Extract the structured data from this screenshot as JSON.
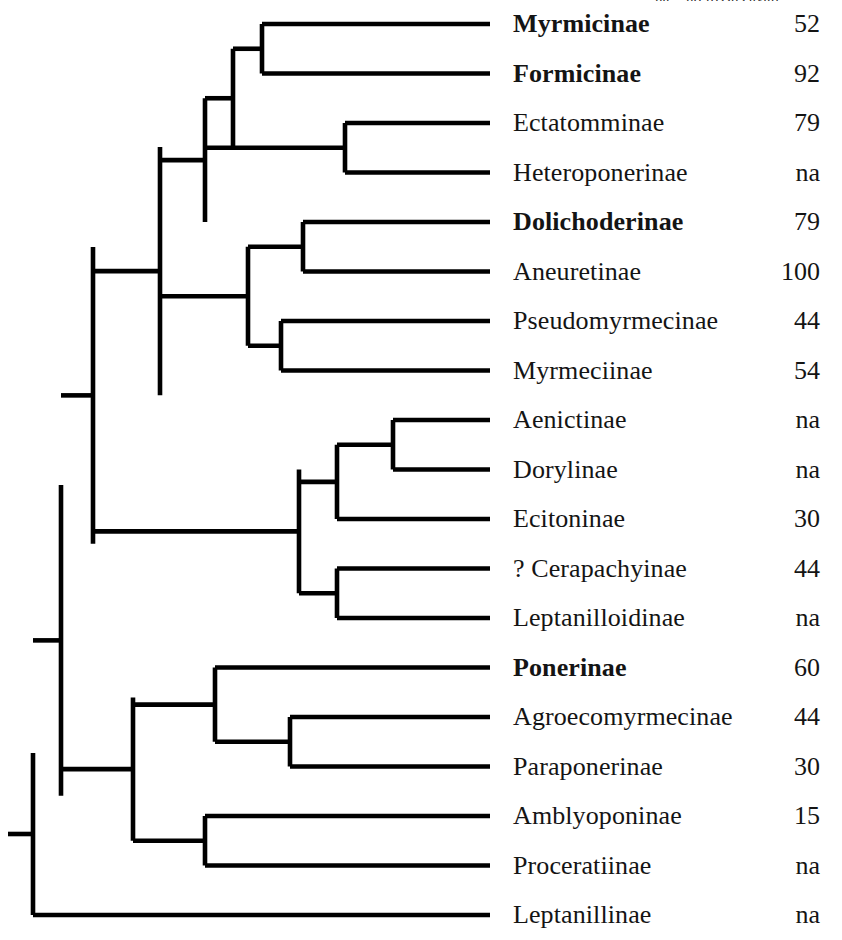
{
  "figure": {
    "legend_note": "na = no fossils avail",
    "line_color": "#000000",
    "text_color": "#141414"
  },
  "columns": {
    "taxon_header": "",
    "age_header": ""
  },
  "tips": [
    {
      "label": "Myrmicinae",
      "value": "52",
      "bold": true,
      "y": 24,
      "tip_x": 262
    },
    {
      "label": "Formicinae",
      "value": "92",
      "bold": true,
      "y": 73.5,
      "tip_x": 262
    },
    {
      "label": "Ectatomminae",
      "value": "79",
      "bold": false,
      "y": 123,
      "tip_x": 345
    },
    {
      "label": "Heteroponerinae",
      "value": "na",
      "bold": false,
      "y": 172.5,
      "tip_x": 345
    },
    {
      "label": "Dolichoderinae",
      "value": "79",
      "bold": true,
      "y": 222,
      "tip_x": 303
    },
    {
      "label": "Aneuretinae",
      "value": "100",
      "bold": false,
      "y": 271.5,
      "tip_x": 303
    },
    {
      "label": "Pseudomyrmecinae",
      "value": "44",
      "bold": false,
      "y": 321,
      "tip_x": 281
    },
    {
      "label": "Myrmeciinae",
      "value": "54",
      "bold": false,
      "y": 370.5,
      "tip_x": 281
    },
    {
      "label": "Aenictinae",
      "value": "na",
      "bold": false,
      "y": 420,
      "tip_x": 393
    },
    {
      "label": "Dorylinae",
      "value": "na",
      "bold": false,
      "y": 469.5,
      "tip_x": 393
    },
    {
      "label": "Ecitoninae",
      "value": "30",
      "bold": false,
      "y": 519,
      "tip_x": 337
    },
    {
      "label": "? Cerapachyinae",
      "value": "44",
      "bold": false,
      "y": 568.5,
      "tip_x": 337
    },
    {
      "label": "Leptanilloidinae",
      "value": "na",
      "bold": false,
      "y": 618,
      "tip_x": 337
    },
    {
      "label": "Ponerinae",
      "value": "60",
      "bold": true,
      "y": 667.5,
      "tip_x": 215
    },
    {
      "label": "Agroecomyrmecinae",
      "value": "44",
      "bold": false,
      "y": 717,
      "tip_x": 290
    },
    {
      "label": "Paraponerinae",
      "value": "30",
      "bold": false,
      "y": 766.5,
      "tip_x": 290
    },
    {
      "label": "Amblyoponinae",
      "value": "15",
      "bold": false,
      "y": 816,
      "tip_x": 205
    },
    {
      "label": "Proceratiinae",
      "value": "na",
      "bold": false,
      "y": 865.5,
      "tip_x": 205
    },
    {
      "label": "Leptanillinae",
      "value": "na",
      "bold": false,
      "y": 915,
      "tip_x": 33
    }
  ],
  "chart_data": {
    "type": "cladogram",
    "tip_count": 19,
    "taxa": [
      "Myrmicinae",
      "Formicinae",
      "Ectatomminae",
      "Heteroponerinae",
      "Dolichoderinae",
      "Aneuretinae",
      "Pseudomyrmecinae",
      "Myrmeciinae",
      "Aenictinae",
      "Dorylinae",
      "Ecitoninae",
      "? Cerapachyinae",
      "Leptanilloidinae",
      "Ponerinae",
      "Agroecomyrmecinae",
      "Paraponerinae",
      "Amblyoponinae",
      "Proceratiinae",
      "Leptanillinae"
    ],
    "values": [
      "52",
      "92",
      "79",
      "na",
      "79",
      "100",
      "44",
      "54",
      "na",
      "na",
      "30",
      "44",
      "na",
      "60",
      "44",
      "30",
      "15",
      "na",
      "na"
    ],
    "value_label": "oldest fossil age (Ma)",
    "na_meaning": "na = no fossils available",
    "bold_taxa": [
      "Myrmicinae",
      "Formicinae",
      "Dolichoderinae",
      "Ponerinae"
    ],
    "newick": "((((((Myrmicinae,Formicinae),(Ectatomminae,Heteroponerinae)),((Dolichoderinae,Aneuretinae),(Pseudomyrmecinae,Myrmeciinae))),(((Aenictinae,Dorylinae),Ecitoninae),(?Cerapachyinae,Leptanilloidinae))),((Ponerinae,(Agroecomyrmecinae,Paraponerinae)),(Amblyoponinae,Proceratiinae))),Leptanillinae);",
    "root_x": 33,
    "tip_x_end": 490,
    "tip_spacing": 49.5,
    "nodes": [
      {
        "name": "root",
        "x": 33,
        "y_top": 753,
        "y_bot": 915
      },
      {
        "name": "crown-formicidae",
        "x": 61,
        "y_top": 485,
        "y_bot": 795.75
      },
      {
        "name": "formicoid",
        "x": 93,
        "y_top": 247,
        "y_bot": 543.75
      },
      {
        "name": "formicoid-core",
        "x": 160,
        "y_top": 147,
        "y_bot": 395.25
      },
      {
        "name": "formicomorph",
        "x": 205,
        "y_top": 98.25,
        "y_bot": 222
      },
      {
        "name": "myrmicine-formica",
        "x": 233,
        "y_top": 48.75,
        "y_bot": 147.75
      },
      {
        "name": "myrm-form-pair",
        "x": 262,
        "y_top": 24,
        "y_bot": 73.5
      },
      {
        "name": "ectat-hetero",
        "x": 345,
        "y_top": 123,
        "y_bot": 172.5
      },
      {
        "name": "dolicho-clade",
        "x": 248,
        "y_top": 246.75,
        "y_bot": 345.75
      },
      {
        "name": "dolicho-aneuret",
        "x": 303,
        "y_top": 222,
        "y_bot": 271.5
      },
      {
        "name": "pseudo-myrmec",
        "x": 281,
        "y_top": 321,
        "y_bot": 370.5
      },
      {
        "name": "dorylomorph",
        "x": 299,
        "y_top": 469.5,
        "y_bot": 593.25
      },
      {
        "name": "doryline-clade",
        "x": 337,
        "y_top": 444.75,
        "y_bot": 519
      },
      {
        "name": "aenict-doryl",
        "x": 393,
        "y_top": 420,
        "y_bot": 469.5
      },
      {
        "name": "cerapach-lepta",
        "x": 337,
        "y_top": 568.5,
        "y_bot": 618
      },
      {
        "name": "poneroid",
        "x": 133,
        "y_top": 697.5,
        "y_bot": 840.75
      },
      {
        "name": "ponerine-clade",
        "x": 215,
        "y_top": 667.5,
        "y_bot": 741.75
      },
      {
        "name": "agroeco-parapon",
        "x": 290,
        "y_top": 717,
        "y_bot": 766.5
      },
      {
        "name": "ambly-procerat",
        "x": 205,
        "y_top": 816,
        "y_bot": 865.5
      }
    ]
  }
}
